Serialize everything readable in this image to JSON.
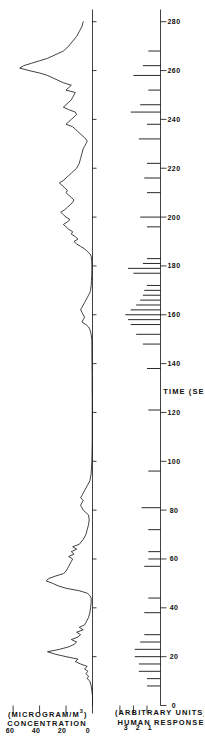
{
  "figure": {
    "orientation": "rotated-90-ccw",
    "background": "#ffffff",
    "ink_color": "#111111"
  },
  "chart_data": [
    {
      "type": "line",
      "id": "concentration-panel",
      "title": "",
      "xlabel": "TIME (SEC)",
      "ylabel": "CONCENTRATION (MICROGRAM/M3)",
      "ylabel_line1": "CONCENTRATION",
      "ylabel_line2_pre": "(MICROGRAM/M",
      "ylabel_line2_sup": "3",
      "ylabel_line2_post": ")",
      "xlim": [
        0,
        285
      ],
      "ylim": [
        0,
        65
      ],
      "yticks": [
        0,
        20,
        40,
        60
      ],
      "ytick_labels": [
        "0",
        "20",
        "40",
        "60"
      ],
      "xticks": [
        0,
        20,
        40,
        60,
        80,
        100,
        120,
        140,
        160,
        180,
        200,
        220,
        240,
        260,
        280
      ],
      "grid": false,
      "legend": "none",
      "x": [
        0,
        2,
        4,
        6,
        8,
        10,
        11,
        12,
        13,
        14,
        15,
        16,
        17,
        18,
        19,
        20,
        21,
        22,
        23,
        24,
        25,
        26,
        27,
        28,
        29,
        30,
        31,
        32,
        33,
        34,
        35,
        36,
        38,
        40,
        42,
        44,
        45,
        46,
        47,
        48,
        49,
        50,
        51,
        52,
        53,
        54,
        55,
        56,
        57,
        58,
        59,
        60,
        61,
        62,
        63,
        64,
        65,
        66,
        68,
        70,
        72,
        74,
        76,
        78,
        79,
        80,
        81,
        82,
        83,
        84,
        85,
        86,
        87,
        88,
        90,
        92,
        95,
        100,
        105,
        110,
        115,
        120,
        125,
        130,
        135,
        140,
        145,
        148,
        150,
        152,
        154,
        155,
        156,
        157,
        158,
        159,
        160,
        161,
        162,
        163,
        164,
        165,
        166,
        167,
        168,
        169,
        170,
        172,
        174,
        176,
        178,
        180,
        182,
        184,
        185,
        186,
        187,
        188,
        189,
        190,
        191,
        192,
        193,
        194,
        195,
        196,
        197,
        198,
        199,
        200,
        201,
        202,
        203,
        204,
        205,
        206,
        207,
        208,
        209,
        210,
        211,
        212,
        213,
        214,
        215,
        216,
        217,
        218,
        219,
        220,
        222,
        224,
        226,
        228,
        229,
        230,
        231,
        232,
        233,
        234,
        235,
        236,
        237,
        238,
        239,
        240,
        241,
        242,
        243,
        244,
        245,
        246,
        247,
        248,
        249,
        250,
        251,
        252,
        253,
        254,
        255,
        256,
        257,
        258,
        259,
        260,
        261,
        262,
        263,
        264,
        265,
        266,
        267,
        268,
        270,
        272,
        274,
        276,
        278,
        280
      ],
      "y": [
        0,
        0,
        0,
        0.5,
        1,
        2,
        4,
        3,
        5,
        3.5,
        6,
        4,
        9,
        13,
        11,
        20,
        28,
        34,
        25,
        18,
        14,
        12,
        16,
        11,
        9,
        12,
        7,
        10,
        6,
        5,
        4,
        3,
        2,
        1.5,
        1,
        1,
        2,
        4,
        10,
        20,
        26,
        30,
        35,
        33,
        28,
        22,
        20,
        19,
        18,
        17,
        16,
        15,
        18,
        14,
        16,
        12,
        15,
        10,
        7,
        5,
        4,
        3,
        2.5,
        3,
        5,
        7,
        8,
        9,
        8,
        7,
        9,
        8,
        7,
        6,
        4,
        2,
        1,
        0.5,
        0.3,
        0.2,
        0.2,
        0.2,
        0.2,
        0.3,
        0.3,
        0.4,
        0.5,
        0.5,
        0.6,
        1,
        2,
        3,
        5,
        8,
        7,
        6,
        7,
        8,
        9,
        8,
        7,
        6,
        5,
        4,
        3,
        2,
        1.5,
        1,
        0.8,
        0.6,
        0.5,
        0.5,
        0.6,
        1,
        2,
        4,
        6,
        9,
        12,
        14,
        11,
        13,
        16,
        15,
        18,
        20,
        22,
        19,
        17,
        20,
        22,
        24,
        21,
        19,
        17,
        15,
        14,
        16,
        18,
        20,
        19,
        21,
        23,
        25,
        22,
        20,
        18,
        16,
        14,
        12,
        10,
        9,
        8,
        7,
        6,
        5,
        4,
        5,
        7,
        9,
        11,
        13,
        15,
        20,
        18,
        16,
        14,
        12,
        13,
        18,
        22,
        20,
        18,
        16,
        15,
        14,
        13,
        20,
        18,
        16,
        22,
        26,
        30,
        34,
        40,
        48,
        55,
        52,
        46,
        40,
        34,
        30,
        26,
        22,
        18,
        15,
        12,
        10,
        8,
        7,
        6,
        6,
        7,
        9,
        12,
        10,
        8,
        7,
        6,
        5,
        4,
        3,
        2,
        1.5,
        1,
        0.8
      ]
    },
    {
      "type": "bar",
      "id": "human-response-panel",
      "title": "",
      "xlabel": "TIME (SEC)",
      "ylabel": "HUMAN RESPONSE (ARBITRARY UNITS)",
      "ylabel_line1": "HUMAN RESPONSE",
      "ylabel_line2": "(ARBITRARY UNITS)",
      "xlim": [
        0,
        285
      ],
      "ylim": [
        0,
        3.4
      ],
      "yticks": [
        1,
        2,
        3
      ],
      "ytick_labels": [
        "1",
        "2",
        "3"
      ],
      "xticks": [
        0,
        20,
        40,
        60,
        80,
        100,
        120,
        140,
        160,
        180,
        200,
        220,
        240,
        260,
        280
      ],
      "xtick_labels": [
        "0",
        "20",
        "40",
        "60",
        "80",
        "100",
        "120",
        "140",
        "160",
        "180",
        "200",
        "220",
        "240",
        "260",
        "280"
      ],
      "grid": false,
      "legend": "none",
      "events_x": [
        8,
        11,
        14,
        17,
        20,
        23,
        26,
        29,
        38,
        44,
        57,
        60,
        63,
        72,
        81,
        96,
        121,
        138,
        148,
        152,
        156,
        158,
        160,
        162,
        164,
        166,
        168,
        170,
        172,
        177,
        179,
        181,
        183,
        196,
        200,
        210,
        216,
        222,
        232,
        238,
        243,
        246,
        252,
        258,
        262,
        268
      ],
      "events_y": [
        1,
        1,
        1.6,
        1.6,
        1.9,
        1.9,
        1.5,
        1.2,
        1.2,
        0.9,
        1.2,
        0.9,
        0.9,
        0.9,
        1.4,
        0.9,
        0.9,
        1.0,
        1.3,
        1.8,
        2.2,
        2.4,
        2.6,
        2.2,
        1.8,
        1.5,
        1.3,
        1.2,
        1.0,
        2.0,
        2.4,
        1.3,
        1.0,
        1.0,
        1.5,
        1.0,
        1.2,
        1.0,
        1.6,
        1.0,
        2.2,
        1.5,
        0.9,
        2.0,
        1.3,
        0.9
      ]
    }
  ],
  "axes": {
    "time": {
      "title": "TIME (SEC)",
      "labels": [
        "0",
        "20",
        "40",
        "60",
        "80",
        "100",
        "120",
        "140",
        "160",
        "180",
        "200",
        "220",
        "240",
        "260",
        "280"
      ]
    },
    "concentration": {
      "title_line1": "CONCENTRATION",
      "title_line2_pre": "(MICROGRAM/M",
      "title_line2_sup": "3",
      "title_line2_post": ")",
      "labels": [
        "0",
        "20",
        "40",
        "60"
      ]
    },
    "response": {
      "title_line1": "HUMAN RESPONSE",
      "title_line2": "(ARBITRARY UNITS)",
      "labels": [
        "1",
        "2",
        "3"
      ]
    }
  }
}
